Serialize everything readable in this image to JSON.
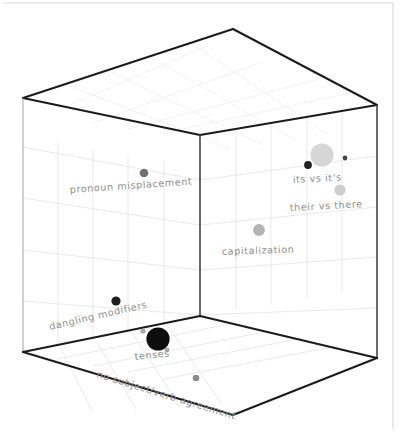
{
  "figure": {
    "title": "",
    "style": "hand-drawn 3d bubble scatter",
    "background_color": "#ffffff",
    "frame_color": "#d9d9d9",
    "axis_color": "#1b1b1b",
    "grid_color": "#e2e2e2"
  },
  "chart_data": {
    "type": "scatter",
    "projection": "3d",
    "title": "",
    "xlabel": "",
    "ylabel": "",
    "zlabel": "",
    "grid": true,
    "legend": "none",
    "axis_ticks_visible": false,
    "xlim": [
      0,
      1
    ],
    "ylim": [
      0,
      1
    ],
    "zlim": [
      0,
      1
    ],
    "categories": [
      "pronoun misplacement",
      "its vs it's",
      "their vs there",
      "capitalization",
      "dangling modifiers",
      "tenses",
      "no subject/verb agreement"
    ],
    "points": [
      {
        "label": "pronoun misplacement",
        "cx": 144,
        "cy": 173,
        "r": 4.3,
        "color": "#6f6f6f",
        "opacity": 1,
        "label_x": 70,
        "label_y": 193,
        "label_rotate": -4,
        "label_anchor": "start",
        "size_rank": 3
      },
      {
        "label": "its vs it's",
        "cx": 308,
        "cy": 165,
        "r": 3.9,
        "color": "#222222",
        "opacity": 1,
        "label_x": 293,
        "label_y": 183,
        "label_rotate": -3,
        "label_anchor": "start",
        "size_rank": 3
      },
      {
        "label": "its vs it's halo",
        "cx": 322,
        "cy": 155,
        "r": 11.5,
        "color": "#cfcfcf",
        "opacity": 0.85,
        "label_x": null,
        "label_y": null,
        "label_rotate": 0,
        "label_anchor": "start",
        "size_rank": 6
      },
      {
        "label": "its vs it's satellite",
        "cx": 345,
        "cy": 158,
        "r": 2.4,
        "color": "#444444",
        "opacity": 1,
        "label_x": null,
        "label_y": null,
        "label_rotate": 0,
        "label_anchor": "start",
        "size_rank": 1
      },
      {
        "label": "their vs there",
        "cx": 340,
        "cy": 190,
        "r": 5.6,
        "color": "#cdcdcd",
        "opacity": 1,
        "label_x": 290,
        "label_y": 211,
        "label_rotate": -3,
        "label_anchor": "start",
        "size_rank": 4
      },
      {
        "label": "capitalization",
        "cx": 259,
        "cy": 230,
        "r": 5.9,
        "color": "#b4b4b4",
        "opacity": 1,
        "label_x": 222,
        "label_y": 255,
        "label_rotate": -2,
        "label_anchor": "start",
        "size_rank": 4
      },
      {
        "label": "dangling modifiers",
        "cx": 116,
        "cy": 301,
        "r": 4.6,
        "color": "#1e1e1e",
        "opacity": 1,
        "label_x": 50,
        "label_y": 330,
        "label_rotate": -13,
        "label_anchor": "start",
        "size_rank": 3
      },
      {
        "label": "tenses",
        "cx": 158,
        "cy": 339,
        "r": 11.6,
        "color": "#0d0d0d",
        "opacity": 1,
        "label_x": 135,
        "label_y": 360,
        "label_rotate": -6,
        "label_anchor": "start",
        "size_rank": 6
      },
      {
        "label": "tenses satellite a",
        "cx": 143,
        "cy": 331,
        "r": 2.6,
        "color": "#a8a8a8",
        "opacity": 1,
        "label_x": null,
        "label_y": null,
        "label_rotate": 0,
        "label_anchor": "start",
        "size_rank": 1
      },
      {
        "label": "tenses satellite b",
        "cx": 167,
        "cy": 350,
        "r": 2.4,
        "color": "#a8a8a8",
        "opacity": 1,
        "label_x": null,
        "label_y": null,
        "label_rotate": 0,
        "label_anchor": "start",
        "size_rank": 1
      },
      {
        "label": "no subject/verb agreement",
        "cx": 196,
        "cy": 378,
        "r": 3.3,
        "color": "#8b8b8b",
        "opacity": 1,
        "label_x": 96,
        "label_y": 377,
        "label_rotate": 17,
        "label_anchor": "start",
        "size_rank": 2
      }
    ]
  },
  "cube": {
    "top_apex": {
      "x": 233,
      "y": 29
    },
    "top_left": {
      "x": 23,
      "y": 98
    },
    "top_right": {
      "x": 377,
      "y": 105
    },
    "top_front": {
      "x": 200,
      "y": 135
    },
    "bottom_left": {
      "x": 23,
      "y": 352
    },
    "bottom_right": {
      "x": 377,
      "y": 358
    },
    "bottom_front": {
      "x": 200,
      "y": 316
    },
    "bottom_apex": {
      "x": 233,
      "y": 415
    }
  },
  "frame": {
    "left": 3,
    "top": 3,
    "right": 393,
    "bottom": 429
  }
}
